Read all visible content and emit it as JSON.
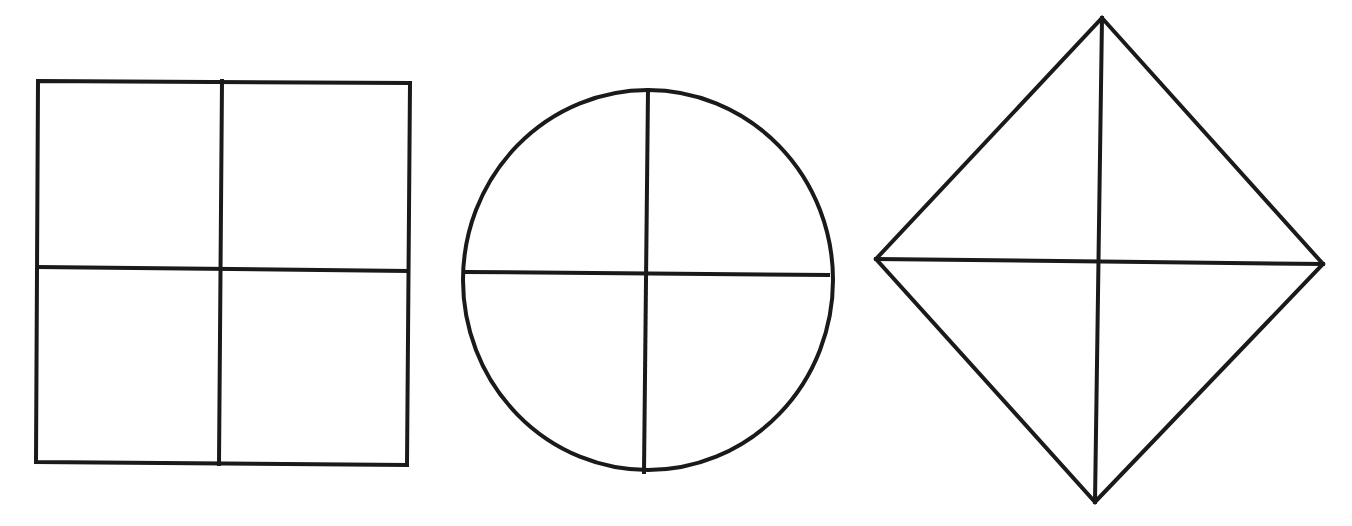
{
  "canvas": {
    "width": 1352,
    "height": 526,
    "background": "#ffffff"
  },
  "style": {
    "stroke_color": "#1a1a1a",
    "stroke_width": 4
  },
  "figures": [
    {
      "id": "square",
      "kind": "square-divided-into-quarters",
      "outline": {
        "points": [
          [
            38,
            81
          ],
          [
            410,
            83
          ],
          [
            407,
            465
          ],
          [
            36,
            462
          ]
        ]
      },
      "dividers": [
        {
          "from": [
            222,
            81
          ],
          "to": [
            219,
            464
          ]
        },
        {
          "from": [
            38,
            267
          ],
          "to": [
            407,
            271
          ]
        }
      ]
    },
    {
      "id": "circle",
      "kind": "circle-divided-into-quarters",
      "outline": {
        "cx": 648,
        "cy": 280,
        "rx": 185,
        "ry": 190
      },
      "dividers": [
        {
          "from": [
            648,
            90
          ],
          "to": [
            644,
            472
          ]
        },
        {
          "from": [
            465,
            272
          ],
          "to": [
            828,
            275
          ]
        }
      ]
    },
    {
      "id": "diamond",
      "kind": "diamond-divided-into-quarters",
      "outline": {
        "points": [
          [
            1102,
            18
          ],
          [
            1323,
            264
          ],
          [
            1095,
            502
          ],
          [
            876,
            259
          ]
        ]
      },
      "dividers": [
        {
          "from": [
            1102,
            18
          ],
          "to": [
            1095,
            502
          ]
        },
        {
          "from": [
            876,
            259
          ],
          "to": [
            1323,
            264
          ]
        }
      ]
    }
  ]
}
